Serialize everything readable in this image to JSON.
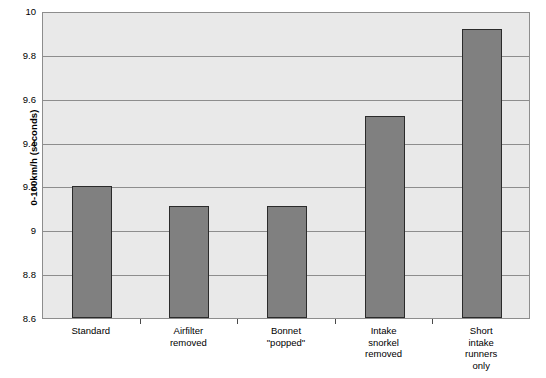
{
  "chart_data": {
    "type": "bar",
    "title": "",
    "xlabel": "",
    "ylabel": "0-100km/h (seconds)",
    "categories": [
      "Standard",
      "Airfilter\nremoved",
      "Bonnet\n\"popped\"",
      "Intake\nsnorkel\nremoved",
      "Short\nintake\nrunners\nonly"
    ],
    "values": [
      9.2,
      9.11,
      9.11,
      9.52,
      9.92
    ],
    "ylim": [
      8.6,
      10
    ],
    "ytick_labels": [
      "10",
      "9.8",
      "9.6",
      "9.4",
      "9.2",
      "9",
      "8.8",
      "8.6"
    ],
    "ytick_values": [
      10,
      9.8,
      9.6,
      9.4,
      9.2,
      9.0,
      8.8,
      8.6
    ],
    "grid": true,
    "legend": "none",
    "colors": {
      "bar_fill": "#808080",
      "bar_border": "#2b2b2b",
      "plot_background": "#e9e9e9",
      "gridline": "#8d8d8d",
      "axis": "#8d8d8d",
      "text": "#000000",
      "page_background": "#ffffff"
    }
  }
}
